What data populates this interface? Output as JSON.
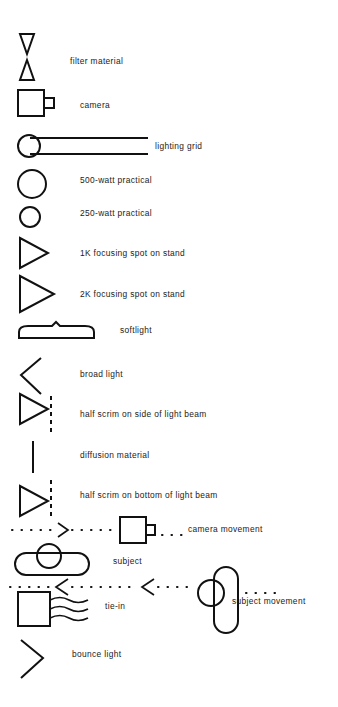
{
  "diagram": {
    "kind": "lighting-plan-symbol-legend",
    "background_color": "#ffffff",
    "ink_color": "#111111",
    "entries": [
      {
        "id": "filter-material",
        "label": "filter material",
        "symbol": "two-opposed-narrow-triangles",
        "label_x": 70,
        "label_y": 62
      },
      {
        "id": "camera",
        "label": "camera",
        "symbol": "square-with-lens-stub",
        "label_x": 80,
        "label_y": 106
      },
      {
        "id": "lighting-grid",
        "label": "lighting grid",
        "symbol": "circle-with-double-rail",
        "label_x": 155,
        "label_y": 147
      },
      {
        "id": "500-watt-practical",
        "label": "500-watt practical",
        "symbol": "large-circle",
        "label_x": 80,
        "label_y": 181
      },
      {
        "id": "250-watt-practical",
        "label": "250-watt practical",
        "symbol": "small-circle",
        "label_x": 80,
        "label_y": 214
      },
      {
        "id": "1k-focusing-spot-on-stand",
        "label": "1K focusing spot on stand",
        "symbol": "triangle-right-medium",
        "label_x": 80,
        "label_y": 254
      },
      {
        "id": "2k-focusing-spot-on-stand",
        "label": "2K focusing spot on stand",
        "symbol": "triangle-right-large",
        "label_x": 80,
        "label_y": 295
      },
      {
        "id": "softlight",
        "label": "softlight",
        "symbol": "flat-rounded-bar-with-notch",
        "label_x": 120,
        "label_y": 331
      },
      {
        "id": "broad-light",
        "label": "broad light",
        "symbol": "open-chevron-left",
        "label_x": 80,
        "label_y": 375
      },
      {
        "id": "half-scrim-on-side-of-light-beam",
        "label": "half scrim on side of light beam",
        "symbol": "triangle-right-with-dashed-vertical",
        "label_x": 80,
        "label_y": 415
      },
      {
        "id": "diffusion-material",
        "label": "diffusion material",
        "symbol": "solid-vertical-line",
        "label_x": 80,
        "label_y": 456
      },
      {
        "id": "half-scrim-on-bottom-of-light-beam",
        "label": "half scrim on bottom of light beam",
        "symbol": "triangle-right-with-dashed-vertical-bottom",
        "label_x": 80,
        "label_y": 496
      },
      {
        "id": "camera-movement",
        "label": "camera movement",
        "symbol": "dotted-path-arrow-right-to-camera",
        "label_x": 188,
        "label_y": 530
      },
      {
        "id": "subject",
        "label": "subject",
        "symbol": "horizontal-capsule-with-head-circle",
        "label_x": 113,
        "label_y": 562
      },
      {
        "id": "subject-movement",
        "label": "subject movement",
        "symbol": "dotted-path-arrows-left-to-vertical-subject",
        "label_x": 232,
        "label_y": 602
      },
      {
        "id": "tie-in",
        "label": "tie-in",
        "symbol": "square-with-three-wavy-lines",
        "label_x": 105,
        "label_y": 607
      },
      {
        "id": "bounce-light",
        "label": "bounce light",
        "symbol": "open-chevron-right",
        "label_x": 72,
        "label_y": 655
      }
    ]
  }
}
